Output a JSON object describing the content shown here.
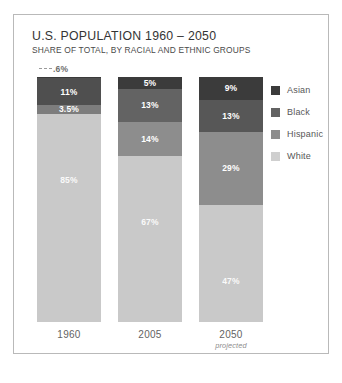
{
  "chart_data": {
    "type": "bar",
    "subtype": "stacked-bar-100pct",
    "title": "U.S. POPULATION 1960 – 2050",
    "subtitle": "SHARE OF TOTAL, BY RACIAL AND ETHNIC GROUPS",
    "xlabel": "",
    "ylabel": "",
    "ylim": [
      0,
      100
    ],
    "grid": false,
    "legend_position": "right",
    "categories": [
      "1960",
      "2005",
      "2050"
    ],
    "category_notes": [
      "",
      "",
      "projected"
    ],
    "series": [
      {
        "name": "Asian",
        "color": "#3b3b3b",
        "values": [
          0.6,
          5,
          9
        ],
        "labels": [
          ".6%",
          "5%",
          "9%"
        ]
      },
      {
        "name": "Black",
        "color": "#666666",
        "values": [
          11,
          13,
          13
        ],
        "labels": [
          "11%",
          "13%",
          "13%"
        ]
      },
      {
        "name": "Hispanic",
        "color": "#8f8f8f",
        "values": [
          3.5,
          14,
          29
        ],
        "labels": [
          "3.5%",
          "14%",
          "29%"
        ]
      },
      {
        "name": "White",
        "color": "#c8c8c8",
        "values": [
          85,
          67,
          47
        ],
        "labels": [
          "85%",
          "67%",
          "47%"
        ]
      }
    ],
    "columns": [
      {
        "category": "1960",
        "note": "",
        "segments": [
          {
            "group": "Asian",
            "value": 0.6,
            "label": ".6%",
            "color": "#3b3b3b",
            "callout": true
          },
          {
            "group": "Black",
            "value": 11,
            "label": "11%",
            "color": "#4f4f4f",
            "callout": false
          },
          {
            "group": "Hispanic",
            "value": 3.5,
            "label": "3.5%",
            "color": "#7d7d7d",
            "callout": false
          },
          {
            "group": "White",
            "value": 85,
            "label": "85%",
            "color": "#c9c9c9",
            "callout": false
          }
        ]
      },
      {
        "category": "2005",
        "note": "",
        "segments": [
          {
            "group": "Asian",
            "value": 5,
            "label": "5%",
            "color": "#3b3b3b",
            "callout": false
          },
          {
            "group": "Black",
            "value": 13,
            "label": "13%",
            "color": "#636363",
            "callout": false
          },
          {
            "group": "Hispanic",
            "value": 14,
            "label": "14%",
            "color": "#8d8d8d",
            "callout": false
          },
          {
            "group": "White",
            "value": 67,
            "label": "67%",
            "color": "#c9c9c9",
            "callout": false
          }
        ]
      },
      {
        "category": "2050",
        "note": "projected",
        "segments": [
          {
            "group": "Asian",
            "value": 9,
            "label": "9%",
            "color": "#3b3b3b",
            "callout": false
          },
          {
            "group": "Black",
            "value": 13,
            "label": "13%",
            "color": "#575757",
            "callout": false
          },
          {
            "group": "Hispanic",
            "value": 29,
            "label": "29%",
            "color": "#8d8d8d",
            "callout": false
          },
          {
            "group": "White",
            "value": 47,
            "label": "47%",
            "color": "#c9c9c9",
            "callout": false
          }
        ]
      }
    ],
    "legend": [
      {
        "label": "Asian",
        "color": "#3b3b3b"
      },
      {
        "label": "Black",
        "color": "#626262"
      },
      {
        "label": "Hispanic",
        "color": "#8d8d8d"
      },
      {
        "label": "White",
        "color": "#cfcfcf"
      }
    ]
  }
}
